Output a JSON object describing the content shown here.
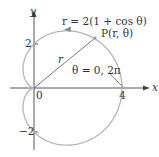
{
  "diagram": {
    "curve_equation": "r = 2(1 + cos θ)",
    "point_label": "P(r, θ)",
    "radius_label": "r",
    "angle_label": "θ = 0, 2π",
    "axes": {
      "x_label": "x",
      "y_label": "y"
    },
    "ticks": {
      "origin": "0",
      "x4": "4",
      "y2": "2",
      "yneg2": "−2"
    },
    "colors": {
      "curve": "#b5b5b5",
      "axis": "#444444",
      "text": "#333333"
    }
  }
}
